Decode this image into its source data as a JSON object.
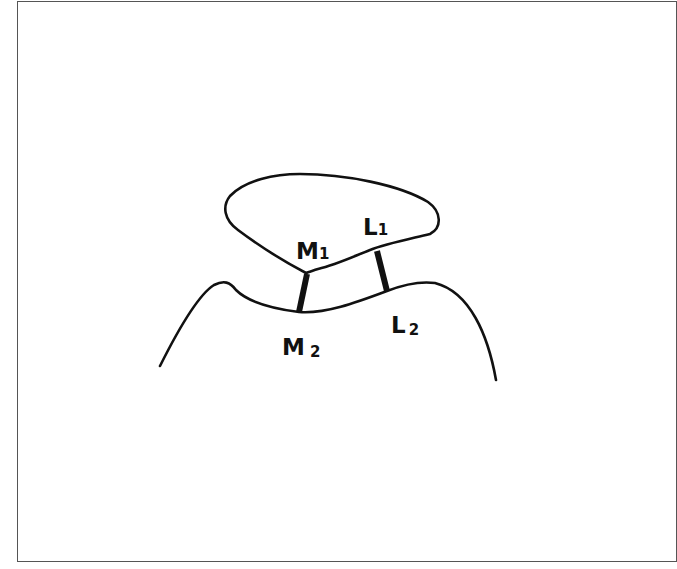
{
  "diagram": {
    "type": "schematic",
    "colors": {
      "stroke": "#111111",
      "frame": "#555555",
      "background": "#ffffff"
    },
    "labels": {
      "m1": {
        "main": "M",
        "sub": "1"
      },
      "l1": {
        "main": "L",
        "sub": "1"
      },
      "m2": {
        "main": "M",
        "sub": "2"
      },
      "l2": {
        "main": "L",
        "sub": "2"
      }
    },
    "connectors": [
      {
        "name": "M",
        "from": "M1",
        "to": "M2"
      },
      {
        "name": "L",
        "from": "L1",
        "to": "L2"
      }
    ]
  }
}
